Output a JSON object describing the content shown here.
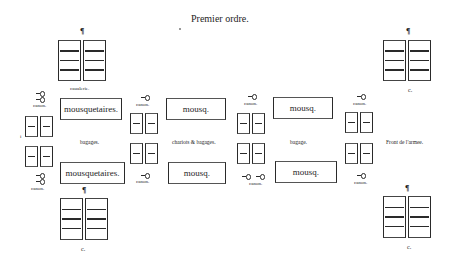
{
  "title": "Premier ordre.",
  "labels": {
    "cavalry_top_left": "caualerie.",
    "cavalry_top_right": "c.",
    "cavalry_bottom_left": "c.",
    "cavalry_bottom_right": "c.",
    "paragraph_mark": "¶",
    "front": "Front de l'armee.",
    "canon": "canon.",
    "baggage_left": "bagages.",
    "baggage_center": "chariots & bagages.",
    "baggage_right": "bagage.",
    "left_marker": "i"
  },
  "musketeers": {
    "top": [
      "mousquetaires.",
      "mousq.",
      "mousq."
    ],
    "bottom": [
      "mousquetaires.",
      "mousq.",
      "mousq."
    ]
  }
}
